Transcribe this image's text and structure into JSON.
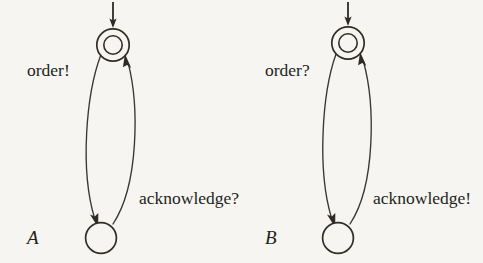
{
  "figure": {
    "type": "state-machine-diagram",
    "background_color": "#f7f5f1",
    "ink_color": "#2e2a26",
    "automata": [
      {
        "id": "A",
        "name_label": "A",
        "states": [
          {
            "id": "A-top",
            "kind": "initial-accepting",
            "shape": "double-circle",
            "cx": 113,
            "cy": 45
          },
          {
            "id": "A-bottom",
            "kind": "normal",
            "shape": "circle",
            "cx": 101,
            "cy": 238
          }
        ],
        "initial_arrow": {
          "from_x": 113,
          "from_y": 2,
          "to_x": 113,
          "to_y": 27
        },
        "transitions": [
          {
            "from": "A-top",
            "to": "A-bottom",
            "label": "order!",
            "direction": "down-left"
          },
          {
            "from": "A-bottom",
            "to": "A-top",
            "label": "acknowledge?",
            "direction": "up-right"
          }
        ]
      },
      {
        "id": "B",
        "name_label": "B",
        "states": [
          {
            "id": "B-top",
            "kind": "initial-accepting",
            "shape": "double-circle",
            "cx": 348,
            "cy": 43
          },
          {
            "id": "B-bottom",
            "kind": "normal",
            "shape": "circle",
            "cx": 338,
            "cy": 238
          }
        ],
        "initial_arrow": {
          "from_x": 348,
          "from_y": 2,
          "to_x": 348,
          "to_y": 25
        },
        "transitions": [
          {
            "from": "B-top",
            "to": "B-bottom",
            "label": "order?",
            "direction": "down-left"
          },
          {
            "from": "B-bottom",
            "to": "B-top",
            "label": "acknowledge!",
            "direction": "up-right"
          }
        ]
      }
    ],
    "labels": {
      "a_order": "order!",
      "a_acknowledge": "acknowledge?",
      "a_name": "A",
      "b_order": "order?",
      "b_acknowledge": "acknowledge!",
      "b_name": "B"
    }
  }
}
